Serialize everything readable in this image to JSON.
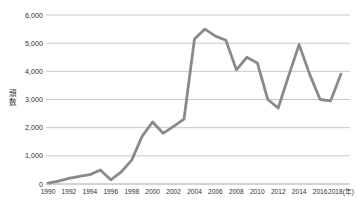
{
  "chart": {
    "ylabel": "頭数",
    "background": "#ffffff"
  },
  "style": {
    "grid_color": "#c9c9c9",
    "axis_color": "#a8a8a8",
    "line_color": "#8a8a8a",
    "label_color": "#303030"
  },
  "chart_data": {
    "type": "line",
    "title": "",
    "xlabel": "(年)",
    "ylabel": "頭数",
    "x": [
      1990,
      1991,
      1992,
      1993,
      1994,
      1995,
      1996,
      1997,
      1998,
      1999,
      2000,
      2001,
      2002,
      2003,
      2004,
      2005,
      2006,
      2007,
      2008,
      2009,
      2010,
      2011,
      2012,
      2013,
      2014,
      2015,
      2016,
      2017,
      2018
    ],
    "values": [
      30,
      100,
      200,
      270,
      330,
      500,
      150,
      430,
      850,
      1700,
      2200,
      1800,
      2050,
      2300,
      5150,
      5500,
      5250,
      5100,
      4050,
      4500,
      4300,
      3000,
      2700,
      3850,
      4950,
      3900,
      3000,
      2950,
      3900
    ],
    "ylim": [
      0,
      6000
    ],
    "ytick_interval": 1000,
    "ytick_labels": [
      "0",
      "1,000",
      "2,000",
      "3,000",
      "4,000",
      "5,000",
      "6,000"
    ],
    "xtick_step": 2,
    "xtick_labels": [
      "1990",
      "1992",
      "1994",
      "1996",
      "1998",
      "2000",
      "2002",
      "2004",
      "2006",
      "2008",
      "2010",
      "2012",
      "2014",
      "2016",
      "2018(年)"
    ],
    "grid": "horizontal",
    "legend": "none",
    "marker": "none"
  }
}
